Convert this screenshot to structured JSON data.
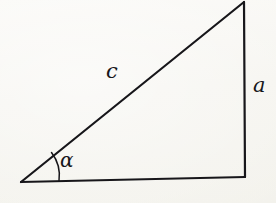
{
  "figure": {
    "name": "right-triangle-with-angle-alpha",
    "background_color": "#f5f4ef",
    "ink_color": "#17161a",
    "width": 276,
    "height": 203
  },
  "labels": {
    "hypotenuse": "c",
    "vertical_side": "a",
    "angle": "α"
  },
  "geometry": {
    "vertices": {
      "left": {
        "x": 21,
        "y": 182
      },
      "apex": {
        "x": 244,
        "y": 2
      },
      "right": {
        "x": 245,
        "y": 177
      }
    },
    "angle_arc": {
      "center_x": 21,
      "center_y": 182,
      "radius": 38,
      "start_x": 57,
      "start_y": 178,
      "end_x": 51,
      "end_y": 153
    },
    "stroke_width": 2.2
  }
}
